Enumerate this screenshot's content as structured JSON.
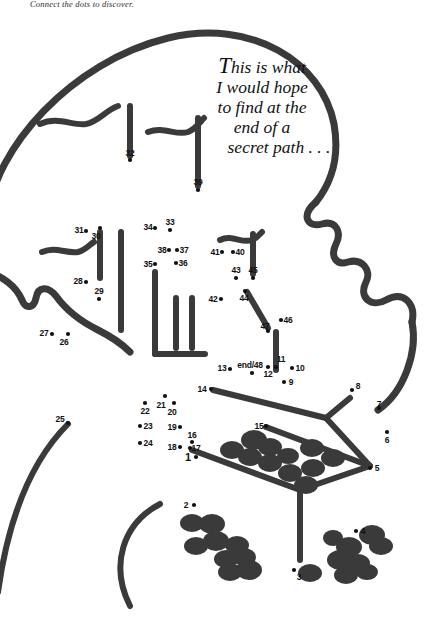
{
  "page": {
    "caption": "Connect the dots to discover.",
    "background_color": "#ffffff",
    "ink_color": "#3a3a3a",
    "dot_color": "#111111",
    "width": 426,
    "height": 624
  },
  "quote": {
    "lines": [
      "This is what",
      "I would hope",
      "to find at the",
      "end of a",
      "secret path . . ."
    ],
    "full_text": "This is what I would hope to find at the end of a secret path . . ."
  },
  "dots": [
    {
      "label": "1",
      "lx": 188,
      "ly": 457,
      "px": 196,
      "py": 457
    },
    {
      "label": "2",
      "lx": 186,
      "ly": 505,
      "px": 194,
      "py": 505
    },
    {
      "label": "3",
      "lx": 299,
      "ly": 577,
      "px": 294,
      "py": 570
    },
    {
      "label": "4",
      "lx": 363,
      "ly": 531,
      "px": 356,
      "py": 531
    },
    {
      "label": "5",
      "lx": 377,
      "ly": 468,
      "px": 370,
      "py": 468
    },
    {
      "label": "6",
      "lx": 387,
      "ly": 440,
      "px": 387,
      "py": 432
    },
    {
      "label": "7",
      "lx": 379,
      "ly": 404,
      "px": 379,
      "py": 408
    },
    {
      "label": "8",
      "lx": 358,
      "ly": 386,
      "px": 352,
      "py": 390
    },
    {
      "label": "9",
      "lx": 291,
      "ly": 382,
      "px": 284,
      "py": 382
    },
    {
      "label": "10",
      "lx": 300,
      "ly": 368,
      "px": 292,
      "py": 368
    },
    {
      "label": "11",
      "lx": 281,
      "ly": 359,
      "px": 276,
      "py": 367
    },
    {
      "label": "12",
      "lx": 268,
      "ly": 374,
      "px": 268,
      "py": 367
    },
    {
      "label": "13",
      "lx": 222,
      "ly": 368,
      "px": 230,
      "py": 369
    },
    {
      "label": "14",
      "lx": 202,
      "ly": 389,
      "px": 211,
      "py": 389
    },
    {
      "label": "15",
      "lx": 259,
      "ly": 426,
      "px": 266,
      "py": 426
    },
    {
      "label": "16",
      "lx": 192,
      "ly": 435,
      "px": 192,
      "py": 442
    },
    {
      "label": "17",
      "lx": 196,
      "ly": 448,
      "px": 190,
      "py": 448
    },
    {
      "label": "18",
      "lx": 172,
      "ly": 447,
      "px": 180,
      "py": 447
    },
    {
      "label": "19",
      "lx": 172,
      "ly": 427,
      "px": 180,
      "py": 427
    },
    {
      "label": "20",
      "lx": 172,
      "ly": 412,
      "px": 174,
      "py": 403
    },
    {
      "label": "21",
      "lx": 161,
      "ly": 405,
      "px": 165,
      "py": 396
    },
    {
      "label": "22",
      "lx": 145,
      "ly": 411,
      "px": 145,
      "py": 403
    },
    {
      "label": "23",
      "lx": 148,
      "ly": 426,
      "px": 140,
      "py": 426
    },
    {
      "label": "24",
      "lx": 148,
      "ly": 443,
      "px": 140,
      "py": 443
    },
    {
      "label": "25",
      "lx": 60,
      "ly": 419,
      "px": 68,
      "py": 423
    },
    {
      "label": "26",
      "lx": 64,
      "ly": 342,
      "px": 68,
      "py": 334
    },
    {
      "label": "27",
      "lx": 44,
      "ly": 333,
      "px": 52,
      "py": 334
    },
    {
      "label": "28",
      "lx": 78,
      "ly": 281,
      "px": 86,
      "py": 282
    },
    {
      "label": "29",
      "lx": 99,
      "ly": 291,
      "px": 99,
      "py": 299
    },
    {
      "label": "30",
      "lx": 96,
      "ly": 236,
      "px": 100,
      "py": 228
    },
    {
      "label": "31",
      "lx": 79,
      "ly": 230,
      "px": 86,
      "py": 231
    },
    {
      "label": "32",
      "lx": 130,
      "ly": 153,
      "px": 130,
      "py": 160
    },
    {
      "label": "33",
      "lx": 170,
      "ly": 222,
      "px": 170,
      "py": 230
    },
    {
      "label": "34",
      "lx": 148,
      "ly": 227,
      "px": 155,
      "py": 228
    },
    {
      "label": "35",
      "lx": 148,
      "ly": 264,
      "px": 155,
      "py": 264
    },
    {
      "label": "36",
      "lx": 183,
      "ly": 263,
      "px": 176,
      "py": 263
    },
    {
      "label": "37",
      "lx": 184,
      "ly": 250,
      "px": 177,
      "py": 250
    },
    {
      "label": "38",
      "lx": 162,
      "ly": 250,
      "px": 169,
      "py": 250
    },
    {
      "label": "39",
      "lx": 198,
      "ly": 182,
      "px": 198,
      "py": 190
    },
    {
      "label": "40",
      "lx": 240,
      "ly": 252,
      "px": 233,
      "py": 252
    },
    {
      "label": "41",
      "lx": 215,
      "ly": 252,
      "px": 222,
      "py": 252
    },
    {
      "label": "42",
      "lx": 213,
      "ly": 299,
      "px": 221,
      "py": 299
    },
    {
      "label": "43",
      "lx": 236,
      "ly": 270,
      "px": 236,
      "py": 278
    },
    {
      "label": "44",
      "lx": 244,
      "ly": 298,
      "px": 245,
      "py": 291
    },
    {
      "label": "45",
      "lx": 253,
      "ly": 270,
      "px": 253,
      "py": 278
    },
    {
      "label": "46",
      "lx": 288,
      "ly": 320,
      "px": 281,
      "py": 320
    },
    {
      "label": "47",
      "lx": 265,
      "ly": 326,
      "px": 268,
      "py": 331
    },
    {
      "label": "end/48",
      "lx": 250,
      "ly": 365,
      "px": 252,
      "py": 373
    }
  ]
}
